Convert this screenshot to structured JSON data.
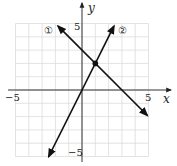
{
  "chart_data": {
    "type": "line",
    "title": "",
    "xlabel": "x",
    "ylabel": "y",
    "xlim": [
      -5,
      5
    ],
    "ylim": [
      -5,
      5
    ],
    "grid": true,
    "tick_labels": {
      "x": [
        "-5",
        "5"
      ],
      "y": [
        "5",
        "-5"
      ]
    },
    "series": [
      {
        "name": "①",
        "equation": "y = -x + 3",
        "x": [
          -1.8,
          4.9
        ],
        "y": [
          4.8,
          -1.9
        ],
        "arrows": "both"
      },
      {
        "name": "②",
        "equation": "y = 2x",
        "x": [
          -2.5,
          2.4
        ],
        "y": [
          -5.0,
          4.8
        ],
        "arrows": "both"
      }
    ],
    "points": [
      {
        "label": "intersection",
        "x": 1,
        "y": 2
      }
    ]
  },
  "labels": {
    "x_axis": "x",
    "y_axis": "y",
    "x_min": "−5",
    "x_max": "5",
    "y_max": "5",
    "y_min": "−5",
    "line1": "①",
    "line2": "②"
  }
}
